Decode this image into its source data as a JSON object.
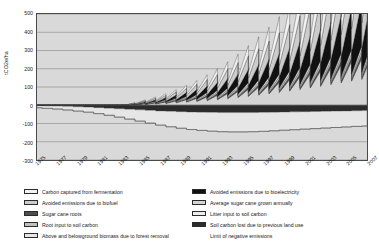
{
  "chart_data": {
    "type": "area",
    "title": "",
    "xlabel": "",
    "ylabel": "tCO2e/ha",
    "ylim": [
      -300,
      500
    ],
    "ytick_values": [
      500,
      400,
      300,
      200,
      100,
      0,
      -100,
      -200,
      -300
    ],
    "ytick_labels": [
      "500",
      "400",
      "300",
      "200",
      "100",
      "0",
      "-100",
      "-200",
      "-300"
    ],
    "grid": true,
    "legend_position": "bottom",
    "x": [
      1975,
      1976,
      1977,
      1978,
      1979,
      1980,
      1981,
      1982,
      1983,
      1984,
      1985,
      1986,
      1987,
      1988,
      1989,
      1990,
      1991,
      1992,
      1993,
      1994,
      1995,
      1996,
      1997,
      1998,
      1999,
      2000,
      2001,
      2002,
      2003,
      2004,
      2005,
      2006,
      2007
    ],
    "xtick_labels": [
      "1975",
      "1977",
      "1979",
      "1981",
      "1983",
      "1985",
      "1987",
      "1989",
      "1991",
      "1993",
      "1995",
      "1997",
      "1999",
      "2001",
      "2003",
      "2005",
      "2007"
    ],
    "series": [
      {
        "name": "Carbon captured from fermentation",
        "fill": "#f2f2f2",
        "values": [
          0,
          0,
          0,
          0,
          0,
          0,
          0,
          0,
          0,
          2,
          4,
          6,
          9,
          12,
          16,
          20,
          26,
          32,
          39,
          47,
          56,
          66,
          77,
          89,
          101,
          114,
          128,
          142,
          157,
          172,
          188,
          205,
          222
        ]
      },
      {
        "name": "Avoided emissions due to biofuel",
        "fill": "#cccccc",
        "values": [
          0,
          0,
          0,
          0,
          0,
          0,
          0,
          0,
          0,
          3,
          6,
          9,
          13,
          18,
          23,
          29,
          36,
          44,
          53,
          63,
          74,
          86,
          99,
          113,
          127,
          142,
          158,
          175,
          192,
          210,
          228,
          247,
          266
        ]
      },
      {
        "name": "Sugar cane roots",
        "fill": "#4d4d4d",
        "values": [
          0,
          0,
          0,
          0,
          0,
          0,
          0,
          0,
          0,
          1,
          2,
          3,
          4,
          5,
          6,
          7,
          8,
          9,
          10,
          11,
          12,
          13,
          14,
          15,
          16,
          17,
          18,
          19,
          20,
          21,
          22,
          23,
          24
        ]
      },
      {
        "name": "Root input to soil carbon",
        "fill": "#bfbfbf",
        "values": [
          0,
          0,
          0,
          0,
          0,
          0,
          0,
          0,
          0,
          1,
          2,
          3,
          4,
          5,
          6,
          7,
          8,
          9,
          10,
          11,
          12,
          13,
          14,
          15,
          16,
          17,
          18,
          19,
          20,
          21,
          22,
          23,
          24
        ]
      },
      {
        "name": "Above and belowground biomass due to forest removal",
        "fill": "#e6e6e6",
        "values": [
          -12,
          -14,
          -17,
          -20,
          -24,
          -28,
          -33,
          -39,
          -46,
          -54,
          -62,
          -70,
          -78,
          -85,
          -91,
          -96,
          -100,
          -103,
          -105,
          -106,
          -106,
          -105,
          -104,
          -102,
          -100,
          -98,
          -96,
          -94,
          -92,
          -90,
          -88,
          -86,
          -85
        ]
      },
      {
        "name": "Avoided emissions due to bioelectricity",
        "fill": "#111111",
        "values": [
          0,
          0,
          0,
          0,
          0,
          0,
          0,
          0,
          0,
          2,
          5,
          8,
          12,
          17,
          22,
          28,
          35,
          43,
          52,
          62,
          73,
          85,
          98,
          112,
          126,
          141,
          157,
          174,
          191,
          209,
          227,
          246,
          265
        ]
      },
      {
        "name": "Average sugar cane grown annually",
        "fill": "#d4d4d4",
        "values": [
          0,
          0,
          0,
          0,
          0,
          0,
          0,
          0,
          0,
          4,
          8,
          13,
          18,
          24,
          31,
          38,
          46,
          55,
          65,
          76,
          88,
          100,
          113,
          127,
          141,
          156,
          172,
          188,
          205,
          222,
          240,
          258,
          277
        ]
      },
      {
        "name": "Litter input to soil carbon",
        "fill": "#ededed",
        "values": [
          0,
          0,
          0,
          0,
          0,
          0,
          0,
          0,
          0,
          1,
          2,
          3,
          4,
          5,
          6,
          7,
          8,
          9,
          10,
          11,
          12,
          13,
          14,
          15,
          16,
          17,
          18,
          19,
          20,
          21,
          22,
          23,
          24
        ]
      },
      {
        "name": "Soil carbon lost due to previous land use",
        "fill": "#2b2b2b",
        "values": [
          -2,
          -3,
          -4,
          -6,
          -8,
          -10,
          -13,
          -16,
          -19,
          -22,
          -25,
          -28,
          -31,
          -33,
          -35,
          -37,
          -38,
          -39,
          -40,
          -40,
          -40,
          -40,
          -39,
          -38,
          -37,
          -36,
          -35,
          -34,
          -33,
          -32,
          -31,
          -30,
          -29
        ]
      }
    ],
    "annotations": [
      {
        "name": "Limit of negative emissions",
        "style": "line",
        "color": "#555555"
      }
    ]
  },
  "axis": {
    "y_label": "tCO2e/ha",
    "y_ticks": [
      "500",
      "400",
      "300",
      "200",
      "100",
      "0",
      "-100",
      "-200",
      "-300"
    ],
    "x_ticks": [
      "1975",
      "1977",
      "1979",
      "1981",
      "1983",
      "1985",
      "1987",
      "1989",
      "1991",
      "1993",
      "1995",
      "1997",
      "1999",
      "2001",
      "2003",
      "2005",
      "2007"
    ]
  },
  "legend": {
    "left_column": [
      {
        "label": "Carbon captured from fermentation",
        "swatch": "#f2f2f2"
      },
      {
        "label": "Avoided emissions due to biofuel",
        "swatch": "#cccccc"
      },
      {
        "label": "Sugar cane roots",
        "swatch": "#4d4d4d"
      },
      {
        "label": "Root input to soil carbon",
        "swatch": "#bfbfbf"
      },
      {
        "label": "Above and belowground biomass due to forest removal",
        "swatch": "#e6e6e6"
      }
    ],
    "right_column": [
      {
        "label": "Avoided emissions due to bioelectricity",
        "swatch": "#111111"
      },
      {
        "label": "Average sugar cane grown annually",
        "swatch": "#d4d4d4"
      },
      {
        "label": "Litter input to soil carbon",
        "swatch": "#ededed"
      },
      {
        "label": "Soil carbon lost due to previous land use",
        "swatch": "#2b2b2b"
      },
      {
        "label": "Limit of negative emissions",
        "swatch": null
      }
    ]
  }
}
